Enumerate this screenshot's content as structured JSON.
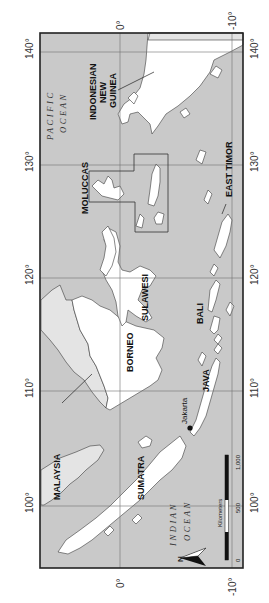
{
  "map": {
    "title": "Indonesia",
    "orientation": "rotated 90 degrees clockwise",
    "colors": {
      "sea": "#c9c9c9",
      "indonesia_land": "#ffffff",
      "other_land": "#e4e4e4",
      "grid": "#6e6e6e",
      "frame": "#222222"
    },
    "longitude_ticks": [
      "100°",
      "110°",
      "120°",
      "130°",
      "140°"
    ],
    "latitude_ticks": [
      "0°",
      "-10°"
    ],
    "labels": {
      "sumatra": "SUMATRA",
      "malaysia": "MALAYSIA",
      "borneo": "BORNEO",
      "java": "JAVA",
      "jakarta": "Jakarta",
      "bali": "BALI",
      "sulawesi": "SULAWESI",
      "moluccas": "MOLUCCAS",
      "east_timor": "EAST TIMOR",
      "new_guinea_line1": "INDONESIAN",
      "new_guinea_line2": "NEW",
      "new_guinea_line3": "GUINEA",
      "pacific_line1": "PACIFIC",
      "pacific_line2": "OCEAN",
      "indian_line1": "INDIAN",
      "indian_line2": "OCEAN"
    },
    "scale_bar": {
      "unit": "Kilometers",
      "ticks": [
        "0",
        "500",
        "1,000"
      ]
    },
    "north_arrow": "N"
  }
}
